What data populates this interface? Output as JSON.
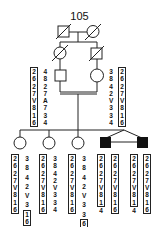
{
  "pedigree": {
    "id": "105",
    "gen1": [
      {
        "sex": "male",
        "status": "deceased"
      },
      {
        "sex": "female",
        "status": "deceased"
      }
    ],
    "gen2": [
      {
        "sex": "female",
        "status": "deceased"
      },
      {
        "sex": "male",
        "status": "deceased"
      }
    ],
    "gen3_parents": [
      {
        "sex": "male",
        "haplotype_boxed": [
          "2",
          "6",
          "2",
          "7",
          "V",
          "8",
          "1",
          "6"
        ],
        "haplotype_other": [
          "4",
          "8",
          "2",
          "7",
          "A",
          "7",
          "3",
          "4"
        ]
      },
      {
        "sex": "female",
        "haplotype_other": [
          "3",
          "8",
          "4",
          "2",
          "V",
          "3",
          "3",
          "4"
        ],
        "haplotype_boxed": [
          "2",
          "6",
          "2",
          "7",
          "V",
          "8",
          "1",
          "6"
        ]
      }
    ],
    "children": [
      {
        "sex": "female",
        "affected": false,
        "haplotype_boxed": [
          "2",
          "6",
          "2",
          "7",
          "V",
          "8",
          "1",
          "6"
        ],
        "haplotype_other_top": [
          "3",
          "8",
          "4",
          "2",
          "V",
          "3"
        ],
        "haplotype_other_boxed": [
          "1",
          "6"
        ]
      },
      {
        "sex": "female",
        "affected": false,
        "haplotype_boxed": [
          "2",
          "6",
          "2",
          "7",
          "V",
          "8",
          "1",
          "6"
        ],
        "haplotype_other": [
          "3",
          "8",
          "4",
          "2",
          "V",
          "3",
          "3",
          "4"
        ]
      },
      {
        "sex": "female",
        "affected": false,
        "haplotype_boxed": [
          "2",
          "6",
          "2",
          "7",
          "V",
          "8",
          "1",
          "6"
        ],
        "haplotype_other_top": [
          "3",
          "8",
          "4",
          "2",
          "V",
          "3",
          "3"
        ],
        "haplotype_other_boxed": [
          "6"
        ]
      },
      {
        "sex": "male",
        "affected": true,
        "twin": "monozygotic",
        "haplotype_boxed": [
          "2",
          "6",
          "2",
          "7",
          "V",
          "8",
          "1"
        ],
        "haplotype_tail": "4",
        "haplotype_boxed2": [
          "2",
          "6",
          "2",
          "7",
          "V",
          "8",
          "1",
          "6"
        ]
      },
      {
        "sex": "male",
        "affected": true,
        "twin": "monozygotic",
        "haplotype_boxed": [
          "2",
          "6",
          "2",
          "7",
          "V",
          "8",
          "1"
        ],
        "haplotype_tail": "4",
        "haplotype_boxed2": [
          "2",
          "6",
          "2",
          "7",
          "V",
          "8",
          "1",
          "6"
        ]
      }
    ]
  }
}
